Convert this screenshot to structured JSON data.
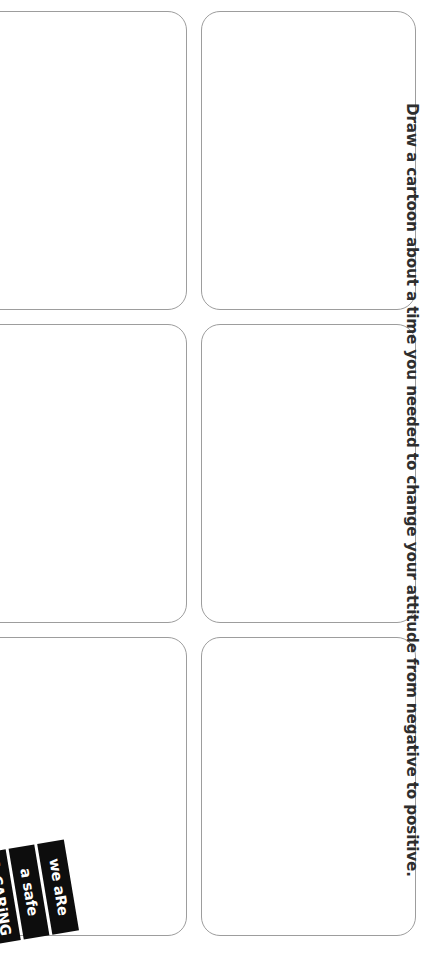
{
  "page": {
    "background_color": "#ffffff",
    "orientation": "landscape-worksheet-rotated-90"
  },
  "prompt": {
    "text": "Draw a cartoon about a time you needed to change your attitude from negative to positive.",
    "color": "#2e2e2e"
  },
  "panels": {
    "border_color": "#9d9d9d",
    "fill_color": "#ffffff",
    "columns": 2,
    "rows": 3,
    "items": [
      {
        "id": "panel-1",
        "label": ""
      },
      {
        "id": "panel-2",
        "label": ""
      },
      {
        "id": "panel-3",
        "label": ""
      },
      {
        "id": "panel-4",
        "label": ""
      },
      {
        "id": "panel-5",
        "label": ""
      },
      {
        "id": "panel-6",
        "label": ""
      }
    ]
  },
  "stamp": {
    "background_color": "#0d0d0d",
    "text_color": "#ffffff",
    "lines": [
      "we aRe",
      "a safe",
      "& CARiNG"
    ]
  }
}
